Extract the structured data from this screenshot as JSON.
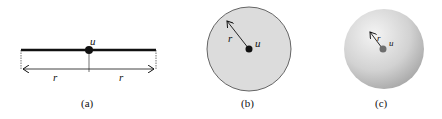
{
  "figure": {
    "panels": [
      {
        "id": "a",
        "caption": "(a)",
        "kind": "1D line segment",
        "point_label": "u",
        "radius_labels": [
          "r",
          "r"
        ]
      },
      {
        "id": "b",
        "caption": "(b)",
        "kind": "2D disk",
        "point_label": "u",
        "radius_label": "r"
      },
      {
        "id": "c",
        "caption": "(c)",
        "kind": "3D ball",
        "point_label": "u",
        "radius_label": "r"
      }
    ],
    "colors": {
      "line": "#111111",
      "disk_fill": "#dcdcdc",
      "disk_stroke": "#555555",
      "sphere_light": "#f2f2f2",
      "sphere_dark": "#a8a8a8",
      "sphere_point": "#6e6e6e"
    }
  }
}
